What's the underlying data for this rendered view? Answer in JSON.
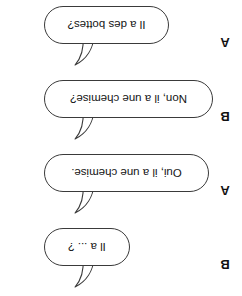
{
  "page": {
    "kind": "french-dialogue-worksheet",
    "background_color": "#ffffff",
    "ink_color": "#3a3a3a",
    "text_color": "#141414",
    "rotation_degrees": 180
  },
  "dialogue": {
    "lines": [
      {
        "speaker": "B",
        "text": "Il a ... ?"
      },
      {
        "speaker": "A",
        "text": "Oui, il a une chemise."
      },
      {
        "speaker": "B",
        "text": "Non, il a une chemise?"
      },
      {
        "speaker": "A",
        "text": "Il a des bottes?"
      }
    ]
  },
  "icons": {
    "bubble_tail": "speech-bubble-tail-icon"
  }
}
